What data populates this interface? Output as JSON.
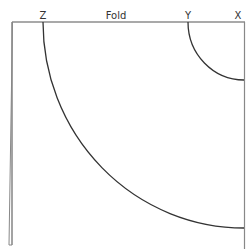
{
  "diagram": {
    "title": "Fold",
    "labels": {
      "z": "Z",
      "y": "Y",
      "x": "X"
    },
    "colors": {
      "line": "#3a3a3a",
      "edge": "#777777",
      "background": "#ffffff"
    }
  }
}
